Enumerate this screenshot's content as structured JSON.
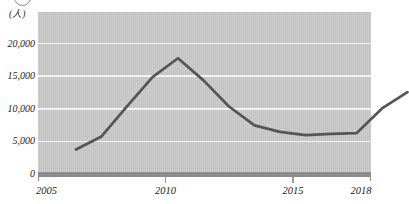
{
  "figure": {
    "top_marker": "1",
    "unit_label": "(人)",
    "background_color": "#ffffff",
    "plot_background_color": "#c9c9c9",
    "gridline_color": "#f4f4f4",
    "line_color": "#555555",
    "axis_color": "#8d8d8d"
  },
  "chart_data": {
    "type": "line",
    "title": "",
    "subtitle": "",
    "xlabel": "",
    "ylabel": "(人)",
    "grid": true,
    "legend": false,
    "legend_position": "none",
    "xlim": [
      2005,
      2018
    ],
    "ylim": [
      0,
      22500
    ],
    "x": [
      2005,
      2006,
      2007,
      2008,
      2009,
      2010,
      2011,
      2012,
      2013,
      2014,
      2015,
      2016,
      2017,
      2018
    ],
    "values": [
      5600,
      7600,
      12200,
      16700,
      19600,
      16200,
      12200,
      9300,
      8300,
      7800,
      8000,
      8100,
      11900,
      14400
    ],
    "series": [
      {
        "name": "人数",
        "color": "#555555",
        "values": [
          5600,
          7600,
          12200,
          16700,
          19600,
          16200,
          12200,
          9300,
          8300,
          7800,
          8000,
          8100,
          11900,
          14400
        ]
      }
    ],
    "y_ticks": [
      0,
      5000,
      10000,
      15000,
      20000
    ],
    "y_tick_labels": [
      "0",
      "5,000",
      "10,000",
      "15,000",
      "20,000"
    ],
    "x_ticks": [
      2005,
      2010,
      2015,
      2018
    ],
    "x_tick_labels": [
      "2005",
      "2010",
      "2015",
      "2018"
    ],
    "annotations": []
  }
}
